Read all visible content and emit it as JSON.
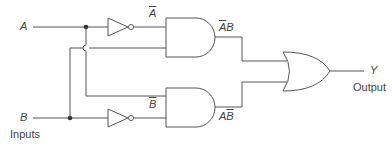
{
  "diagram": {
    "type": "logic-circuit",
    "function": "XOR",
    "inputs": [
      {
        "name": "A",
        "label": "A"
      },
      {
        "name": "B",
        "label": "B"
      }
    ],
    "inputs_caption": "Inputs",
    "gates": [
      {
        "id": "not_a",
        "type": "NOT",
        "input": "A",
        "output_label": "A",
        "output_overline": true
      },
      {
        "id": "not_b",
        "type": "NOT",
        "input": "B",
        "output_label": "B",
        "output_overline": true
      },
      {
        "id": "and_1",
        "type": "AND",
        "inputs": [
          "NOT A",
          "B"
        ],
        "output_label_a": "A",
        "output_label_b": "B",
        "expression": "A̅B"
      },
      {
        "id": "and_2",
        "type": "AND",
        "inputs": [
          "A",
          "NOT B"
        ],
        "output_label_a": "A",
        "output_label_b": "B",
        "expression": "AB̅"
      },
      {
        "id": "or_1",
        "type": "OR",
        "inputs": [
          "A̅B",
          "AB̅"
        ],
        "output": "Y"
      }
    ],
    "output": {
      "name": "Y",
      "label": "Y",
      "caption": "Output"
    },
    "colors": {
      "line": "#555555",
      "text": "#444444",
      "background": "#ffffff"
    }
  }
}
